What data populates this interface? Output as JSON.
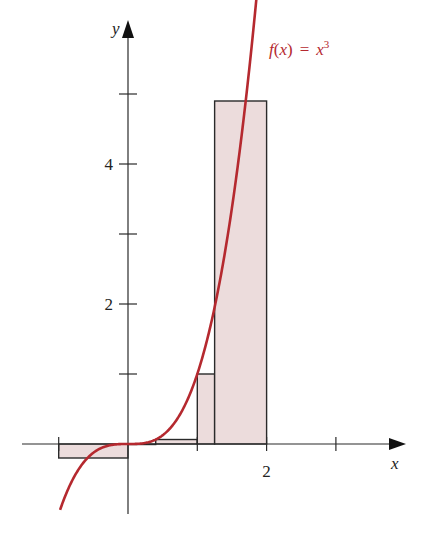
{
  "chart_data": {
    "type": "line",
    "title": "",
    "function_label": "f(x) = x³",
    "function_label_parts": {
      "f": "f",
      "open": "(",
      "x": "x",
      "close": ")",
      "eq": "=",
      "base": "x",
      "exp": "3"
    },
    "xlabel": "x",
    "ylabel": "y",
    "x_ticks": [
      -1,
      0,
      1,
      2,
      3
    ],
    "x_tick_labels": {
      "2": "2"
    },
    "y_ticks": [
      1,
      2,
      3,
      4,
      5
    ],
    "y_tick_labels": {
      "2": "2",
      "4": "4"
    },
    "xlim": [
      -1.35,
      3.9
    ],
    "ylim": [
      -1.0,
      6.0
    ],
    "grid": false,
    "series": [
      {
        "name": "f(x) = x^3",
        "kind": "curve",
        "domain": [
          -0.98,
          1.88
        ],
        "color": "#b5292f"
      }
    ],
    "riemann_rectangles": [
      {
        "x0": -1.0,
        "x1": 0.0,
        "height": -0.2
      },
      {
        "x0": 0.0,
        "x1": 0.4,
        "height": 0.0
      },
      {
        "x0": 0.4,
        "x1": 1.0,
        "height": 0.064
      },
      {
        "x0": 1.0,
        "x1": 1.25,
        "height": 1.0
      },
      {
        "x0": 1.25,
        "x1": 2.0,
        "height": 4.9
      }
    ],
    "colors": {
      "curve": "#b5292f",
      "rect_fill": "#ecdcdc",
      "rect_stroke": "#2a2a2a",
      "axis": "#2a2a2a"
    }
  }
}
